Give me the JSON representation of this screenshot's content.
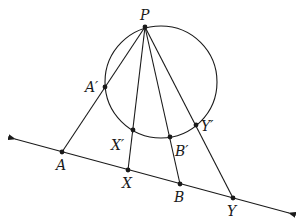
{
  "diagram": {
    "stroke_color": "#1a1a1a",
    "circle": {
      "cx": 161,
      "cy": 82,
      "r": 56
    },
    "line": {
      "x1": 15,
      "y1": 139,
      "x2": 289,
      "y2": 213
    },
    "points": {
      "P": {
        "label": "P",
        "x": 145,
        "y": 27,
        "lx": 140,
        "ly": 20
      },
      "A1": {
        "label": "A′",
        "x": 105,
        "y": 87,
        "lx": 85,
        "ly": 92
      },
      "X1": {
        "label": "X′",
        "x": 133,
        "y": 130,
        "lx": 111,
        "ly": 150
      },
      "B1": {
        "label": "B′",
        "x": 170,
        "y": 137,
        "lx": 175,
        "ly": 156
      },
      "Y1": {
        "label": "Y′",
        "x": 196,
        "y": 125,
        "lx": 201,
        "ly": 131
      },
      "A": {
        "label": "A",
        "x": 62,
        "y": 152,
        "lx": 56,
        "ly": 170
      },
      "X": {
        "label": "X",
        "x": 128,
        "y": 170,
        "lx": 122,
        "ly": 188
      },
      "B": {
        "label": "B",
        "x": 180,
        "y": 184,
        "lx": 174,
        "ly": 202
      },
      "Y": {
        "label": "Y",
        "x": 233,
        "y": 198,
        "lx": 227,
        "ly": 216
      }
    },
    "segments": [
      [
        "P",
        "A"
      ],
      [
        "P",
        "X"
      ],
      [
        "P",
        "B"
      ],
      [
        "P",
        "Y"
      ]
    ]
  }
}
